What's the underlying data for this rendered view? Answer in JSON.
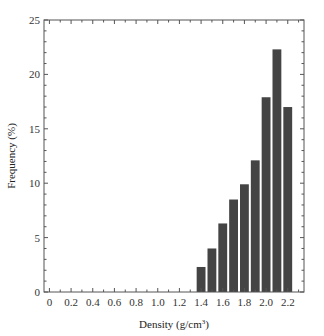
{
  "chart_data": {
    "type": "bar",
    "title": "",
    "xlabel": "Density (g/cm³)",
    "xlabel_base": "Density (g/cm",
    "xlabel_sup": "3",
    "xlabel_end": ")",
    "ylabel": "Frequency (%)",
    "xlim": [
      -0.05,
      2.35
    ],
    "ylim": [
      0,
      25
    ],
    "x_ticks": [
      "0",
      "0.2",
      "0.4",
      "0.6",
      "0.8",
      "1.0",
      "1.2",
      "1.4",
      "1.6",
      "1.8",
      "2.0",
      "2.2"
    ],
    "x_tick_values": [
      0,
      0.2,
      0.4,
      0.6,
      0.8,
      1.0,
      1.2,
      1.4,
      1.6,
      1.8,
      2.0,
      2.2
    ],
    "y_ticks": [
      "0",
      "5",
      "10",
      "15",
      "20",
      "25"
    ],
    "y_tick_values": [
      0,
      5,
      10,
      15,
      20,
      25
    ],
    "grid": false,
    "legend": null,
    "categories": [
      "1.4",
      "1.5",
      "1.6",
      "1.7",
      "1.8",
      "1.9",
      "2.0",
      "2.1",
      "2.2"
    ],
    "x": [
      1.4,
      1.5,
      1.6,
      1.7,
      1.8,
      1.9,
      2.0,
      2.1,
      2.2
    ],
    "values": [
      2.3,
      4.0,
      6.3,
      8.5,
      9.9,
      12.1,
      17.9,
      22.3,
      17.0
    ],
    "bar_color": "#444444"
  }
}
